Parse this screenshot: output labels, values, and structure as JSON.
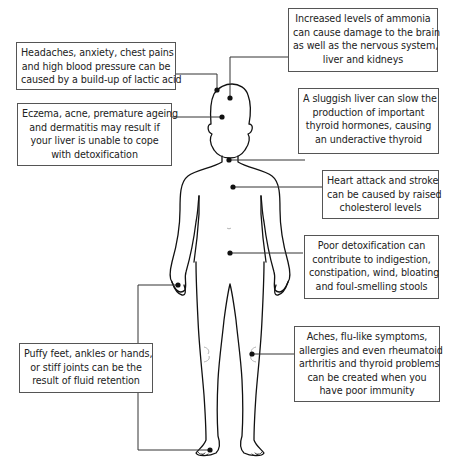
{
  "diagram": {
    "type": "body-symptom-callouts",
    "callouts": [
      {
        "id": "lactic-acid",
        "lines": [
          "Headaches, anxiety, chest pains",
          "and high blood pressure can be",
          "caused by a build-up of lactic acid"
        ],
        "target": "top of head"
      },
      {
        "id": "ammonia",
        "lines": [
          "Increased levels of ammonia",
          "can cause damage to the brain",
          "as well as the nervous system,",
          "liver and kidneys"
        ],
        "target": "brain"
      },
      {
        "id": "skin",
        "lines": [
          "Eczema, acne, premature ageing",
          "and dermatitis may result if",
          "your liver is unable to cope",
          "with detoxification"
        ],
        "target": "face"
      },
      {
        "id": "thyroid",
        "lines": [
          "A sluggish liver can slow the",
          "production of important",
          "thyroid hormones, causing",
          "an underactive thyroid"
        ],
        "target": "throat"
      },
      {
        "id": "cholesterol",
        "lines": [
          "Heart attack and stroke",
          "can be caused by raised",
          "cholesterol levels"
        ],
        "target": "chest"
      },
      {
        "id": "digestion",
        "lines": [
          "Poor detoxification can",
          "contribute to indigestion,",
          "constipation, wind, bloating",
          "and foul-smelling stools"
        ],
        "target": "abdomen"
      },
      {
        "id": "fluid-retention",
        "lines": [
          "Puffy feet, ankles or hands,",
          "or stiff joints can be the",
          "result of fluid retention"
        ],
        "target": "hand and foot"
      },
      {
        "id": "immunity",
        "lines": [
          "Aches, flu-like symptoms,",
          "allergies and even rheumatoid",
          "arthritis and thyroid problems",
          "can be created when you",
          "have poor immunity"
        ],
        "target": "knee"
      }
    ],
    "colors": {
      "line": "#111111",
      "box_border": "#555555",
      "text": "#222222",
      "background": "#ffffff"
    }
  }
}
